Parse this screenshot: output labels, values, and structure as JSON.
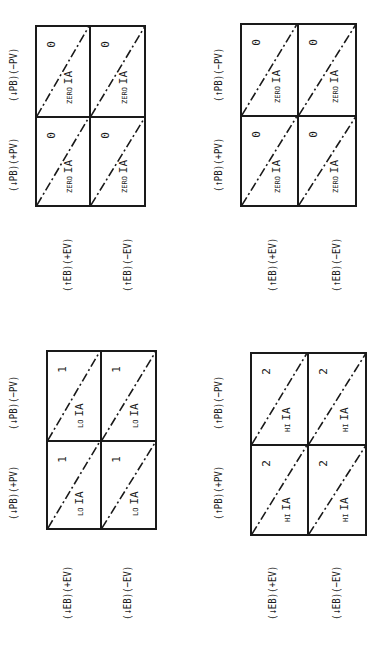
{
  "diagrams": [
    {
      "id": "top-left",
      "col_labels": [
        "(↓PB)(+PV)",
        "(↓PB)(−PV)"
      ],
      "row_labels": [
        "(↑EB)(+EV)",
        "(↑EB)(−EV)"
      ],
      "cells": [
        {
          "level": "ZERO",
          "tag": "IA",
          "value": "0"
        },
        {
          "level": "ZERO",
          "tag": "IA",
          "value": "0"
        },
        {
          "level": "ZERO",
          "tag": "IA",
          "value": "0"
        },
        {
          "level": "ZERO",
          "tag": "IA",
          "value": "0"
        }
      ]
    },
    {
      "id": "top-right",
      "col_labels": [
        "(↑PB)(+PV)",
        "(↑PB)(−PV)"
      ],
      "row_labels": [
        "(↑EB)(+EV)",
        "(↑EB)(−EV)"
      ],
      "cells": [
        {
          "level": "ZERO",
          "tag": "IA",
          "value": "0"
        },
        {
          "level": "ZERO",
          "tag": "IA",
          "value": "0"
        },
        {
          "level": "ZERO",
          "tag": "IA",
          "value": "0"
        },
        {
          "level": "ZERO",
          "tag": "IA",
          "value": "0"
        }
      ]
    },
    {
      "id": "bottom-left",
      "col_labels": [
        "(↓PB)(+PV)",
        "(↓PB)(−PV)"
      ],
      "row_labels": [
        "(↓EB)(+EV)",
        "(↓EB)(−EV)"
      ],
      "cells": [
        {
          "level": "LO",
          "tag": "IA",
          "value": "1"
        },
        {
          "level": "LO",
          "tag": "IA",
          "value": "1"
        },
        {
          "level": "LO",
          "tag": "IA",
          "value": "1"
        },
        {
          "level": "LO",
          "tag": "IA",
          "value": "1"
        }
      ]
    },
    {
      "id": "bottom-right",
      "col_labels": [
        "(↑PB)(+PV)",
        "(↑PB)(−PV)"
      ],
      "row_labels": [
        "(↓EB)(+EV)",
        "(↓EB)(−EV)"
      ],
      "cells": [
        {
          "level": "HI",
          "tag": "IA",
          "value": "2"
        },
        {
          "level": "HI",
          "tag": "IA",
          "value": "2"
        },
        {
          "level": "HI",
          "tag": "IA",
          "value": "2"
        },
        {
          "level": "HI",
          "tag": "IA",
          "value": "2"
        }
      ]
    }
  ],
  "style": {
    "line_color": "#1a1a1a",
    "background": "#ffffff"
  }
}
